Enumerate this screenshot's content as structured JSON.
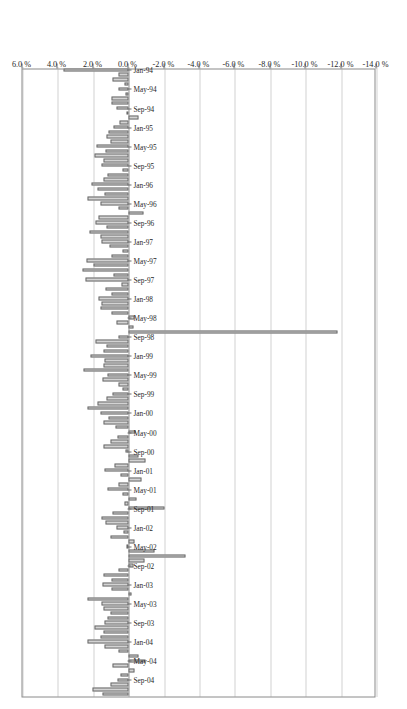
{
  "chart_data": {
    "type": "bar",
    "orientation": "horizontal",
    "title": "CS/Tremont Event Driven",
    "xlabel": "",
    "ylabel": "",
    "grid": true,
    "legend": false,
    "value_axis": {
      "ticks": [
        "6.0 %",
        "4.0 %",
        "2.0 %",
        "0.0 %",
        "-2.0 %",
        "-4.0 %",
        "-6.0 %",
        "-8.0 %",
        "-10.0 %",
        "-12.0 %",
        "-14.0 %"
      ],
      "tick_values": [
        6.0,
        4.0,
        2.0,
        0.0,
        -2.0,
        -4.0,
        -6.0,
        -8.0,
        -10.0,
        -12.0,
        -14.0
      ],
      "limits": [
        6.0,
        -14.0
      ],
      "units": "%"
    },
    "category_axis": {
      "visible_tick_labels": [
        "Jan-94",
        "May-94",
        "Sep-94",
        "Jan-95",
        "May-95",
        "Sep-95",
        "Jan-96",
        "May-96",
        "Sep-96",
        "Jan-97",
        "May-97",
        "Sep-97",
        "Jan-98",
        "May-98",
        "Sep-98",
        "Jan-99",
        "May-99",
        "Sep-99",
        "Jan-00",
        "May-00",
        "Sep-00",
        "Jan-01",
        "May-01",
        "Sep-01",
        "Jan-02",
        "May-02",
        "Sep-02",
        "Jan-03",
        "May-03",
        "Sep-03",
        "Jan-04",
        "May-04",
        "Sep-04"
      ],
      "label_interval_months": 4,
      "first_category": "Jan-94",
      "last_category": "Dec-04"
    },
    "categories": [
      "Jan-94",
      "Feb-94",
      "Mar-94",
      "Apr-94",
      "May-94",
      "Jun-94",
      "Jul-94",
      "Aug-94",
      "Sep-94",
      "Oct-94",
      "Nov-94",
      "Dec-94",
      "Jan-95",
      "Feb-95",
      "Mar-95",
      "Apr-95",
      "May-95",
      "Jun-95",
      "Jul-95",
      "Aug-95",
      "Sep-95",
      "Oct-95",
      "Nov-95",
      "Dec-95",
      "Jan-96",
      "Feb-96",
      "Mar-96",
      "Apr-96",
      "May-96",
      "Jun-96",
      "Jul-96",
      "Aug-96",
      "Sep-96",
      "Oct-96",
      "Nov-96",
      "Dec-96",
      "Jan-97",
      "Feb-97",
      "Mar-97",
      "Apr-97",
      "May-97",
      "Jun-97",
      "Jul-97",
      "Aug-97",
      "Sep-97",
      "Oct-97",
      "Nov-97",
      "Dec-97",
      "Jan-98",
      "Feb-98",
      "Mar-98",
      "Apr-98",
      "May-98",
      "Jun-98",
      "Jul-98",
      "Aug-98",
      "Sep-98",
      "Oct-98",
      "Nov-98",
      "Dec-98",
      "Jan-99",
      "Feb-99",
      "Mar-99",
      "Apr-99",
      "May-99",
      "Jun-99",
      "Jul-99",
      "Aug-99",
      "Sep-99",
      "Oct-99",
      "Nov-99",
      "Dec-99",
      "Jan-00",
      "Feb-00",
      "Mar-00",
      "Apr-00",
      "May-00",
      "Jun-00",
      "Jul-00",
      "Aug-00",
      "Sep-00",
      "Oct-00",
      "Nov-00",
      "Dec-00",
      "Jan-01",
      "Feb-01",
      "Mar-01",
      "Apr-01",
      "May-01",
      "Jun-01",
      "Jul-01",
      "Aug-01",
      "Sep-01",
      "Oct-01",
      "Nov-01",
      "Dec-01",
      "Jan-02",
      "Feb-02",
      "Mar-02",
      "Apr-02",
      "May-02",
      "Jun-02",
      "Jul-02",
      "Aug-02",
      "Sep-02",
      "Oct-02",
      "Nov-02",
      "Dec-02",
      "Jan-03",
      "Feb-03",
      "Mar-03",
      "Apr-03",
      "May-03",
      "Jun-03",
      "Jul-03",
      "Aug-03",
      "Sep-03",
      "Oct-03",
      "Nov-03",
      "Dec-03",
      "Jan-04",
      "Feb-04",
      "Mar-04",
      "Apr-04",
      "May-04",
      "Jun-04",
      "Jul-04",
      "Aug-04",
      "Sep-04",
      "Oct-04",
      "Nov-04",
      "Dec-04"
    ],
    "values": [
      3.7,
      0.6,
      0.9,
      0.25,
      0.55,
      0.2,
      0.95,
      1.0,
      0.7,
      0.15,
      -0.55,
      0.5,
      0.85,
      1.15,
      1.25,
      1.05,
      1.8,
      1.3,
      1.95,
      1.4,
      1.55,
      0.35,
      1.2,
      1.45,
      2.1,
      1.75,
      1.35,
      2.35,
      1.6,
      0.55,
      -0.85,
      1.7,
      1.85,
      1.25,
      2.2,
      1.6,
      1.55,
      1.1,
      0.35,
      0.95,
      2.4,
      2.0,
      2.6,
      0.85,
      2.45,
      0.4,
      1.3,
      0.95,
      1.7,
      1.55,
      1.6,
      0.95,
      -0.35,
      0.7,
      -0.3,
      -11.8,
      0.55,
      1.9,
      1.25,
      1.45,
      2.15,
      1.35,
      1.45,
      2.55,
      1.2,
      1.5,
      0.55,
      0.35,
      0.9,
      1.25,
      1.75,
      2.3,
      1.6,
      1.15,
      1.45,
      0.75,
      -0.4,
      0.65,
      1.05,
      1.4,
      0.2,
      -0.55,
      -0.95,
      0.8,
      1.35,
      0.45,
      -0.75,
      0.55,
      1.2,
      0.35,
      -0.45,
      0.25,
      -2.05,
      0.9,
      1.55,
      1.3,
      0.7,
      0.3,
      1.05,
      -0.35,
      0.15,
      -1.45,
      -3.2,
      -0.9,
      -0.25,
      0.55,
      1.45,
      1.0,
      1.5,
      0.95,
      -0.15,
      2.35,
      1.55,
      1.45,
      1.05,
      1.2,
      1.35,
      1.95,
      1.45,
      1.6,
      2.35,
      1.35,
      0.55,
      -0.55,
      -0.95,
      0.9,
      -0.35,
      0.45,
      0.65,
      1.05,
      2.05,
      1.5
    ]
  }
}
